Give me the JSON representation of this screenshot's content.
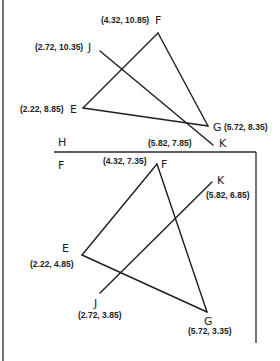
{
  "diagram": {
    "colors": {
      "line": "#1e1e1e",
      "text": "#222222",
      "background": "#ffffff"
    },
    "top_panel": {
      "points": {
        "F": {
          "label": "F",
          "coord_text": "(4.32, 10.85)",
          "x": 4.32,
          "y": 10.85
        },
        "J": {
          "label": "J",
          "coord_text": "(2.72, 10.35)",
          "x": 2.72,
          "y": 10.35
        },
        "E": {
          "label": "E",
          "coord_text": "(2.22, 8.85)",
          "x": 2.22,
          "y": 8.85
        },
        "G": {
          "label": "G",
          "coord_text": "(5.72, 8.35)",
          "x": 5.72,
          "y": 8.35
        },
        "K": {
          "label": "K",
          "coord_text": "(5.82, 7.85)",
          "x": 5.82,
          "y": 7.85
        }
      },
      "segments": [
        "EF",
        "FG",
        "GE",
        "JK"
      ]
    },
    "divider": {
      "above_label": "H",
      "below_label": "F"
    },
    "bottom_panel": {
      "points": {
        "F": {
          "label": "F",
          "coord_text": "(4.32, 7.35)",
          "x": 4.32,
          "y": 7.35
        },
        "K": {
          "label": "K",
          "coord_text": "(5.82, 6.85)",
          "x": 5.82,
          "y": 6.85
        },
        "E": {
          "label": "E",
          "coord_text": "(2.22, 4.85)",
          "x": 2.22,
          "y": 4.85
        },
        "J": {
          "label": "J",
          "coord_text": "(2.72, 3.85)",
          "x": 2.72,
          "y": 3.85
        },
        "G": {
          "label": "G",
          "coord_text": "(5.72, 3.35)",
          "x": 5.72,
          "y": 3.35
        }
      },
      "segments": [
        "EF",
        "FG",
        "GE",
        "JK"
      ]
    }
  }
}
